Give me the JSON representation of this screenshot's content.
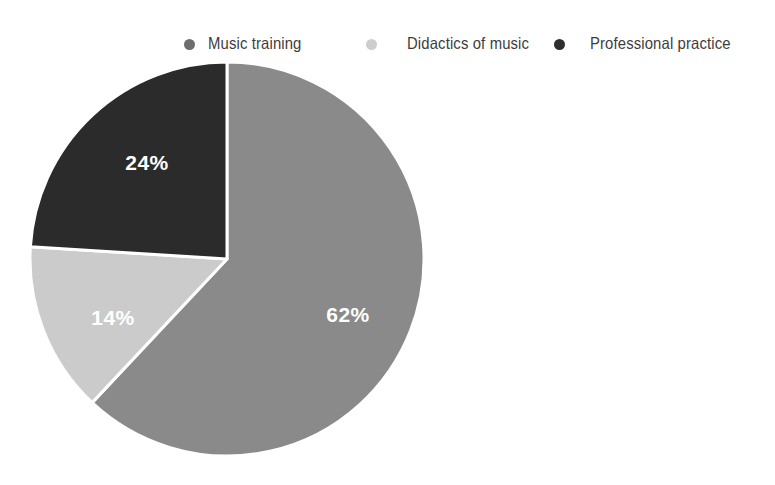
{
  "chart_data": {
    "type": "pie",
    "title": "",
    "subtitle": "",
    "xlabel": "",
    "ylabel": "",
    "legend_position": "top",
    "grid": false,
    "units": "percent",
    "total": 100,
    "start_angle_deg": 0,
    "direction": "clockwise",
    "categories": [
      "Music training",
      "Didactics of music",
      "Professional practice"
    ],
    "values": [
      62,
      14,
      24
    ],
    "labels": [
      "62%",
      "14%",
      "24%"
    ],
    "colors": [
      "#8a8a8a",
      "#cbcbcb",
      "#2b2b2b"
    ],
    "slices": [
      {
        "name": "Music training",
        "value": 62,
        "label": "62%",
        "color": "#8a8a8a",
        "start_deg": 0,
        "end_deg": 223.2,
        "label_color": "#ffffff"
      },
      {
        "name": "Didactics of music",
        "value": 14,
        "label": "14%",
        "color": "#cbcbcb",
        "start_deg": 223.2,
        "end_deg": 273.6,
        "label_color": "#ffffff"
      },
      {
        "name": "Professional practice",
        "value": 24,
        "label": "24%",
        "color": "#2b2b2b",
        "start_deg": 273.6,
        "end_deg": 360,
        "label_color": "#ffffff"
      }
    ]
  },
  "legend": {
    "items": [
      {
        "label": "Music training",
        "color": "#6e6e6e",
        "marker": "legend-dot-icon"
      },
      {
        "label": "Didactics of music",
        "color": "#cdcdcd",
        "marker": "legend-dot-icon"
      },
      {
        "label": "Professional practice",
        "color": "#2e2e2e",
        "marker": "legend-dot-icon"
      }
    ]
  },
  "pie": {
    "center_x": 227,
    "center_y": 259,
    "radius": 197,
    "separator_color": "#ffffff",
    "separator_width": 3,
    "labels": [
      {
        "text": "62%",
        "x": 348,
        "y": 322,
        "color": "#ffffff"
      },
      {
        "text": "14%",
        "x": 113,
        "y": 325,
        "color": "#ffffff"
      },
      {
        "text": "24%",
        "x": 147,
        "y": 170,
        "color": "#ffffff"
      }
    ]
  },
  "background": {
    "color": "#ffffff"
  }
}
